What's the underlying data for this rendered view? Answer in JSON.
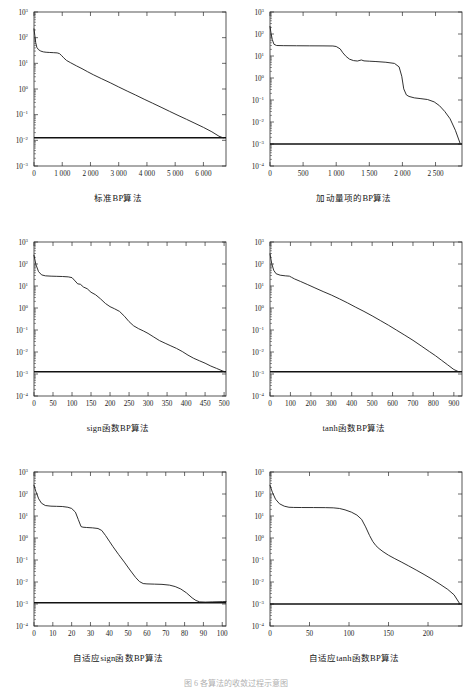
{
  "page": {
    "bottom_caption": "图 6 各算法的收敛过程示意图",
    "background": "#ffffff",
    "curve_color": "#1a1a1a",
    "goal_color": "#111111"
  },
  "chart_data": [
    {
      "id": "standard-bp",
      "type": "line",
      "title": "标准BP算法",
      "xlabel": "",
      "ylabel": "",
      "yscale": "log",
      "ylim": [
        0.001,
        1000
      ],
      "ytick_labels": [
        "10³",
        "10²",
        "10¹",
        "10⁰",
        "10⁻¹",
        "10⁻²",
        "10⁻³"
      ],
      "ytick_values": [
        1000,
        100,
        10,
        1,
        0.1,
        0.01,
        0.001
      ],
      "xlim": [
        0,
        6800
      ],
      "xtick_labels": [
        "0",
        "1 000",
        "2 000",
        "3 000",
        "4 000",
        "5 000",
        "6 000"
      ],
      "xtick_values": [
        0,
        1000,
        2000,
        3000,
        4000,
        5000,
        6000
      ],
      "grid": false,
      "legend": null,
      "goal_line": 0.0125,
      "series": [
        {
          "name": "Training error",
          "x": [
            0,
            30,
            60,
            100,
            160,
            240,
            330,
            430,
            560,
            700,
            820,
            900,
            980,
            1050,
            1150,
            1300,
            1500,
            1700,
            1900,
            2100,
            2400,
            2700,
            3000,
            3300,
            3600,
            3900,
            4200,
            4500,
            4800,
            5100,
            5400,
            5700,
            6000,
            6300,
            6550,
            6700
          ],
          "y": [
            220,
            120,
            65,
            42,
            34,
            30,
            28,
            27,
            26.5,
            26,
            25.5,
            24,
            20,
            16.5,
            13,
            10.5,
            8.0,
            6.2,
            4.7,
            3.6,
            2.5,
            1.75,
            1.2,
            0.83,
            0.58,
            0.4,
            0.28,
            0.195,
            0.135,
            0.094,
            0.066,
            0.046,
            0.032,
            0.0215,
            0.0145,
            0.0125
          ]
        }
      ]
    },
    {
      "id": "momentum-bp",
      "type": "line",
      "title": "加动量项的BP算法",
      "xlabel": "",
      "ylabel": "",
      "yscale": "log",
      "ylim": [
        0.0001,
        1000
      ],
      "ytick_labels": [
        "10³",
        "10²",
        "10¹",
        "10⁰",
        "10⁻¹",
        "10⁻²",
        "10⁻³",
        "10⁻⁴"
      ],
      "ytick_values": [
        1000,
        100,
        10,
        1,
        0.1,
        0.01,
        0.001,
        0.0001
      ],
      "xlim": [
        0,
        2900
      ],
      "xtick_labels": [
        "0",
        "500",
        "1 000",
        "1 500",
        "2 000",
        "2 500"
      ],
      "xtick_values": [
        0,
        500,
        1000,
        1500,
        2000,
        2500
      ],
      "grid": false,
      "legend": null,
      "goal_line": 0.001,
      "series": [
        {
          "name": "Training error",
          "x": [
            0,
            15,
            35,
            60,
            100,
            200,
            400,
            600,
            800,
            950,
            1000,
            1060,
            1100,
            1150,
            1200,
            1260,
            1320,
            1380,
            1420,
            1500,
            1600,
            1750,
            1880,
            1950,
            1990,
            2020,
            2060,
            2100,
            2180,
            2280,
            2380,
            2480,
            2560,
            2640,
            2720,
            2800,
            2870
          ],
          "y": [
            220,
            110,
            55,
            34,
            30,
            29.5,
            29.2,
            29,
            28.8,
            28.5,
            27,
            21,
            14,
            9.5,
            7.2,
            6.2,
            5.9,
            6.6,
            6.0,
            5.8,
            5.6,
            5.2,
            4.6,
            3.2,
            1.2,
            0.32,
            0.17,
            0.145,
            0.125,
            0.115,
            0.105,
            0.082,
            0.055,
            0.03,
            0.014,
            0.0042,
            0.0011
          ]
        }
      ]
    },
    {
      "id": "sign-bp",
      "type": "line",
      "title": "sign函数BP算法",
      "xlabel": "",
      "ylabel": "",
      "yscale": "log",
      "ylim": [
        0.0001,
        1000
      ],
      "ytick_labels": [
        "10³",
        "10²",
        "10¹",
        "10⁰",
        "10⁻¹",
        "10⁻²",
        "10⁻³",
        "10⁻⁴"
      ],
      "ytick_values": [
        1000,
        100,
        10,
        1,
        0.1,
        0.01,
        0.001,
        0.0001
      ],
      "xlim": [
        0,
        505
      ],
      "xtick_labels": [
        "0",
        "50",
        "100",
        "150",
        "200",
        "250",
        "300",
        "350",
        "400",
        "450",
        "500"
      ],
      "xtick_values": [
        0,
        50,
        100,
        150,
        200,
        250,
        300,
        350,
        400,
        450,
        500
      ],
      "grid": false,
      "legend": null,
      "goal_line": 0.00125,
      "series": [
        {
          "name": "Training error",
          "x": [
            0,
            5,
            12,
            20,
            30,
            45,
            60,
            75,
            90,
            100,
            108,
            115,
            122,
            130,
            140,
            150,
            162,
            175,
            188,
            200,
            212,
            225,
            238,
            250,
            262,
            275,
            288,
            300,
            315,
            330,
            345,
            360,
            375,
            390,
            405,
            420,
            435,
            450,
            465,
            480,
            495,
            502
          ],
          "y": [
            250,
            95,
            45,
            32,
            29,
            28,
            27.5,
            27,
            26,
            24,
            17,
            12.5,
            12,
            9.0,
            7.5,
            5.2,
            4.0,
            2.6,
            1.6,
            1.15,
            0.92,
            0.7,
            0.42,
            0.24,
            0.155,
            0.115,
            0.09,
            0.07,
            0.048,
            0.033,
            0.025,
            0.019,
            0.0145,
            0.0105,
            0.0072,
            0.0052,
            0.004,
            0.0031,
            0.0023,
            0.0018,
            0.0014,
            0.00125
          ]
        }
      ]
    },
    {
      "id": "tanh-bp",
      "type": "line",
      "title": "tanh函数BP算法",
      "xlabel": "",
      "ylabel": "",
      "yscale": "log",
      "ylim": [
        0.0001,
        1000
      ],
      "ytick_labels": [
        "10³",
        "10²",
        "10¹",
        "10⁰",
        "10⁻¹",
        "10⁻²",
        "10⁻³",
        "10⁻⁴"
      ],
      "ytick_values": [
        1000,
        100,
        10,
        1,
        0.1,
        0.01,
        0.001,
        0.0001
      ],
      "xlim": [
        0,
        940
      ],
      "xtick_labels": [
        "0",
        "100",
        "200",
        "300",
        "400",
        "500",
        "600",
        "700",
        "800",
        "900"
      ],
      "xtick_values": [
        0,
        100,
        200,
        300,
        400,
        500,
        600,
        700,
        800,
        900
      ],
      "grid": false,
      "legend": null,
      "goal_line": 0.00125,
      "series": [
        {
          "name": "Training error",
          "x": [
            0,
            8,
            18,
            30,
            50,
            75,
            95,
            105,
            120,
            150,
            185,
            220,
            260,
            300,
            340,
            380,
            420,
            460,
            500,
            540,
            580,
            620,
            660,
            700,
            740,
            780,
            810,
            840,
            870,
            900,
            925
          ],
          "y": [
            290,
            110,
            52,
            36,
            31,
            29,
            28,
            25,
            21,
            16,
            11.5,
            8.2,
            5.6,
            3.9,
            2.6,
            1.7,
            1.08,
            0.7,
            0.44,
            0.27,
            0.165,
            0.098,
            0.058,
            0.034,
            0.019,
            0.0105,
            0.0068,
            0.0042,
            0.0026,
            0.0016,
            0.00125
          ]
        }
      ]
    },
    {
      "id": "adaptive-sign-bp",
      "type": "line",
      "title": "自适应sign函数BP算法",
      "xlabel": "",
      "ylabel": "",
      "yscale": "log",
      "ylim": [
        0.0001,
        1000
      ],
      "ytick_labels": [
        "10³",
        "10²",
        "10¹",
        "10⁰",
        "10⁻¹",
        "10⁻²",
        "10⁻³",
        "10⁻⁴"
      ],
      "ytick_values": [
        1000,
        100,
        10,
        1,
        0.1,
        0.01,
        0.001,
        0.0001
      ],
      "xlim": [
        0,
        102
      ],
      "xtick_labels": [
        "0",
        "10",
        "20",
        "30",
        "40",
        "50",
        "60",
        "70",
        "80",
        "90",
        "100"
      ],
      "xtick_values": [
        0,
        10,
        20,
        30,
        40,
        50,
        60,
        70,
        80,
        90,
        100
      ],
      "grid": false,
      "legend": null,
      "goal_line": 0.00115,
      "series": [
        {
          "name": "Training error",
          "x": [
            0,
            1,
            2.5,
            4,
            6,
            9,
            12,
            15,
            18,
            20,
            22,
            23.5,
            25,
            26,
            28,
            31,
            34,
            36,
            38,
            40,
            42,
            45,
            48,
            51,
            54,
            56,
            58,
            60,
            64,
            68,
            72,
            75,
            78,
            81,
            84,
            86,
            88,
            91,
            95,
            100,
            102
          ],
          "y": [
            250,
            130,
            60,
            38,
            30,
            28,
            27.5,
            27,
            25,
            22,
            15,
            7.0,
            3.3,
            3.1,
            3.0,
            2.9,
            2.7,
            2.2,
            1.3,
            0.72,
            0.4,
            0.175,
            0.08,
            0.035,
            0.016,
            0.0105,
            0.0085,
            0.0082,
            0.008,
            0.0078,
            0.0072,
            0.0062,
            0.0048,
            0.0032,
            0.0019,
            0.00145,
            0.00125,
            0.00122,
            0.00125,
            0.00128,
            0.0013
          ]
        }
      ]
    },
    {
      "id": "adaptive-tanh-bp",
      "type": "line",
      "title": "自适应tanh函数BP算法",
      "xlabel": "",
      "ylabel": "",
      "yscale": "log",
      "ylim": [
        0.0001,
        1000
      ],
      "ytick_labels": [
        "10³",
        "10²",
        "10¹",
        "10⁰",
        "10⁻¹",
        "10⁻²",
        "10⁻³",
        "10⁻⁴"
      ],
      "ytick_values": [
        1000,
        100,
        10,
        1,
        0.1,
        0.01,
        0.001,
        0.0001
      ],
      "xlim": [
        0,
        243
      ],
      "xtick_labels": [
        "0",
        "50",
        "100",
        "150",
        "200"
      ],
      "xtick_values": [
        0,
        50,
        100,
        150,
        200
      ],
      "grid": false,
      "legend": null,
      "goal_line": 0.001,
      "series": [
        {
          "name": "Training error",
          "x": [
            0,
            3,
            7,
            12,
            18,
            24,
            30,
            40,
            55,
            70,
            80,
            88,
            95,
            103,
            110,
            116,
            121,
            126,
            130,
            134,
            138,
            143,
            150,
            158,
            166,
            175,
            185,
            195,
            205,
            215,
            225,
            233,
            240
          ],
          "y": [
            250,
            120,
            58,
            36,
            28,
            25,
            24.5,
            24.3,
            24.2,
            24,
            23.5,
            22,
            19,
            15,
            11,
            7.0,
            3.2,
            1.3,
            0.7,
            0.45,
            0.33,
            0.24,
            0.165,
            0.115,
            0.082,
            0.055,
            0.035,
            0.022,
            0.0135,
            0.008,
            0.0046,
            0.0026,
            0.00105
          ]
        }
      ]
    }
  ]
}
